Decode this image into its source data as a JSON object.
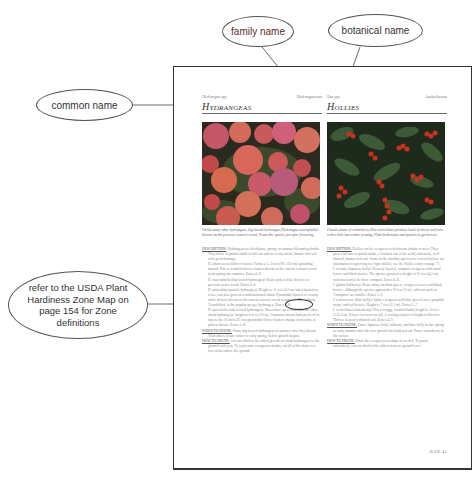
{
  "callouts": {
    "family_name": "family name",
    "botanical_name": "botanical name",
    "common_name": "common name",
    "zone_note": [
      "refer to the USDA Plant",
      "Hardiness Zone Map on",
      "page 154 for Zone",
      "definitions"
    ]
  },
  "page": {
    "left": {
      "botanical": "Hydrangea spp.",
      "family": "Hydrangeaceae",
      "title": "Hydrangeas",
      "photo_alt": "pink hydrangea blooms",
      "caption": "Unlike many other hydrangeas, big-leaved hydrangea (Hydrangea macrophylla) blooms on the previous season's wood. Prune this species just after flowering.",
      "body": [
        {
          "label": "Description:",
          "text": " Hydrangeas are deciduous, spring- or summer-blooming shrubs. They thrive in partial shade to full sun and in evenly moist, humus-rich soil with good drainage."
        },
        {
          "text": "H. arborescens (hills-of-snow): Forms a 3–5 foot (90–150 cm) spreading mound. Flat or rounded flower clusters bloom on the current season's wood from spring into summer. Zones 4–8."
        },
        {
          "text": "H. macrophylla (big-leaved hydrangea): Bears pink or blue flowers on previous year's wood. Zones 6–8."
        },
        {
          "text": "H. paniculata (panicle hydrangea): Height to 15 feet (4.5 m) when trained as a tree; can also grow as a multistemmed shrub. Pyramidal clusters of creamy white flowers bloom on the current season's wood in summer. The cultivar 'Grandiflora' is the popular peegee hydrangea. Zones 4–8."
        },
        {
          "text": "H. quercifolia (oak-leaved hydrangea): Has a more open form than the other shrub hydrangeas; height to 6 feet (1.8 m). Cinnamon brown bark peels off in layers; the 10 inch (25 cm) pyramidal flower clusters change from white to pink to brown. Zones 5–8."
        },
        {
          "label": "When to prune:",
          "text": " Prune big-leaved hydrangeas in summer after they bloom. Trim others in late winter or early spring, before growth begins."
        },
        {
          "label": "How to prune:",
          "text": " Cut one-third of the oldest growth on shrub hydrangeas to the ground each year. To rejuvenate overgrown shrubs, cut all of the stems to a few inches above the ground."
        }
      ],
      "zone_marked": "Zones 4–8"
    },
    "right": {
      "botanical": "Ilex spp.",
      "family": "Aquifoliaceae",
      "title": "Hollies",
      "photo_alt": "winterberry holly with red berries",
      "caption": "Female plants of winterberry (Ilex verticillata) produce loads of showy red fruits with a little late-winter pruning. Plant both males and females to get berries.",
      "body": [
        {
          "label": "Description:",
          "text": " Hollies can be evergreen or deciduous shrubs or trees. They prefer full sun or partial shade, a location out of the wind, and moist, well-drained, humus-rich soil. Some of the shrubby species are covered below; for information on growing tree-type hollies, see the Hollies entry on page 71."
        },
        {
          "text": "I. crenata (Japanese holly): Densely layered, compact evergreen with small leaves and black berries. The species grows to a height of 15 feet (4.5 m); cultivars tend to be more compact. Zones 6–8."
        },
        {
          "text": "I. glabra (inkberry): Bears shiny, medium green, evergreen leaves and black berries. Although the species approaches 10 feet (3 m), cultivars such as 'Compacta' are smaller. Zones 5–9."
        },
        {
          "text": "I. x meserveae (blue holly): Spiny evergreen with blue-green leaves, purplish stems, and red berries. Height to 7 feet (2.1 m). Zones 5–7."
        },
        {
          "text": "I. verticillata (winterberry): Has a twiggy, rounded habit; height 6–10 feet (1.8–3 m). It loses its leaves in fall, revealing clusters of bright red berries. Thrives in poorly drained soil. Zones 4–9."
        },
        {
          "label": "When to prune:",
          "text": " Prune Japanese holly, inkberry, and blue holly in late spring or early summer after the new growth has hardened off. Prune winterberry in late winter."
        },
        {
          "label": "How to prune:",
          "text": " Prune the evergreens to shape as needed. To prune winterberry, cut one-third of the oldest stems to ground level."
        }
      ]
    },
    "folio": "ILEX 41"
  }
}
